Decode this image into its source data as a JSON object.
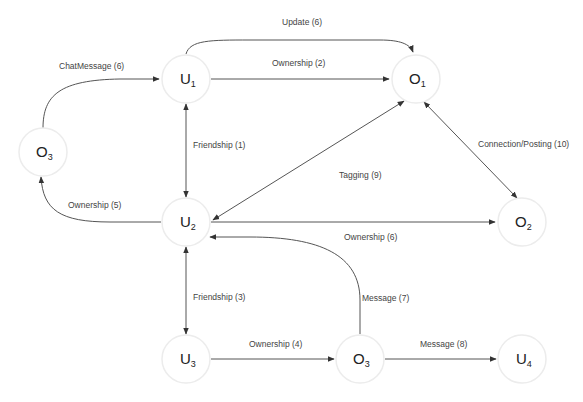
{
  "diagram": {
    "nodes": [
      {
        "id": "U1",
        "letter": "U",
        "sub": "1"
      },
      {
        "id": "O1",
        "letter": "O",
        "sub": "1"
      },
      {
        "id": "O3a",
        "letter": "O",
        "sub": "3"
      },
      {
        "id": "U2",
        "letter": "U",
        "sub": "2"
      },
      {
        "id": "O2",
        "letter": "O",
        "sub": "2"
      },
      {
        "id": "U3",
        "letter": "U",
        "sub": "3"
      },
      {
        "id": "O3b",
        "letter": "O",
        "sub": "3"
      },
      {
        "id": "U4",
        "letter": "U",
        "sub": "4"
      }
    ],
    "edges": [
      {
        "id": "e-update",
        "from": "U1",
        "to": "O1",
        "label": "Update (6)",
        "directed": "forward"
      },
      {
        "id": "e-ownership-2",
        "from": "U1",
        "to": "O1",
        "label": "Ownership (2)",
        "directed": "forward"
      },
      {
        "id": "e-chatmessage",
        "from": "O3a",
        "to": "U1",
        "label": "ChatMessage (6)",
        "directed": "forward"
      },
      {
        "id": "e-friendship-1",
        "from": "U1",
        "to": "U2",
        "label": "Friendship  (1)",
        "directed": "both"
      },
      {
        "id": "e-ownership-5",
        "from": "U2",
        "to": "O3a",
        "label": "Ownership (5)",
        "directed": "forward"
      },
      {
        "id": "e-tagging",
        "from": "O1",
        "to": "U2",
        "label": "Tagging (9)",
        "directed": "both"
      },
      {
        "id": "e-connection",
        "from": "O1",
        "to": "O2",
        "label": "Connection/Posting (10)",
        "directed": "both"
      },
      {
        "id": "e-ownership-6",
        "from": "U2",
        "to": "O2",
        "label": "Ownership (6)",
        "directed": "forward"
      },
      {
        "id": "e-friendship-3",
        "from": "U2",
        "to": "U3",
        "label": "Friendship (3)",
        "directed": "both"
      },
      {
        "id": "e-message-7",
        "from": "O3b",
        "to": "U2",
        "label": "Message (7)",
        "directed": "forward"
      },
      {
        "id": "e-ownership-4",
        "from": "U3",
        "to": "O3b",
        "label": "Ownership (4)",
        "directed": "forward"
      },
      {
        "id": "e-message-8",
        "from": "O3b",
        "to": "U4",
        "label": "Message (8)",
        "directed": "forward"
      }
    ]
  }
}
